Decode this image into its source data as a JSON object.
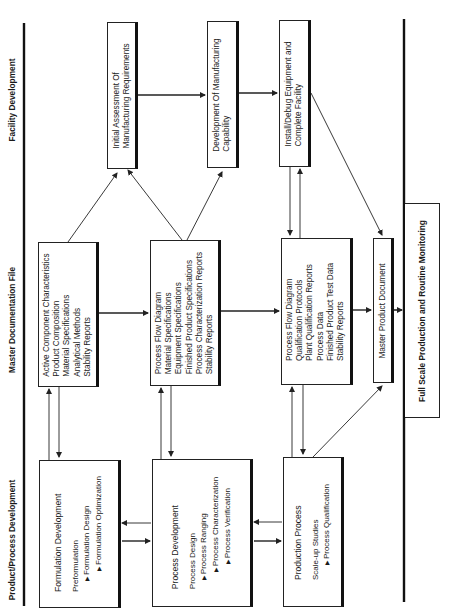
{
  "lanes": {
    "facility": "Facility Development",
    "master": "Master Documentation File",
    "product": "Product/Process Development"
  },
  "facility_boxes": {
    "initial_assessment": [
      "Initial Assessment Of",
      "Manufacturing Requirements"
    ],
    "development_capability": [
      "Development Of Manufacturing",
      "Capability"
    ],
    "install_debug": [
      "Install/Debug Equipment and",
      "Complete Facility"
    ]
  },
  "master_boxes": {
    "formulation_docs": [
      "Active Component Characteristics",
      "Product Composition",
      "Material Specifications",
      "Analytical Methods",
      "Stability Reports"
    ],
    "process_docs": [
      "Process Flow Diagram",
      "Material Specifications",
      "Equipment Specifications",
      "Finished Product Specifications",
      "Process Characterization Reports",
      "Stability Reports"
    ],
    "production_docs": [
      "Process Flow Diagram",
      "Qualification Protocols",
      "Plant Qualification Reports",
      "Process Data",
      "Finished Product Test Data",
      "Stability Reports"
    ],
    "master_product_document": "Master Product Document"
  },
  "product_boxes": {
    "formulation": {
      "title": "Formulation Development",
      "steps": [
        "Preformulation",
        "Formulation Design",
        "Formulation Optimization"
      ]
    },
    "process": {
      "title": "Process Development",
      "steps": [
        "Process Design",
        "Process Ranging",
        "Process Characterization",
        "Process Verification"
      ]
    },
    "production": {
      "title": "Production Process",
      "steps": [
        "Scale-up Studies",
        "Process Qualification"
      ]
    }
  },
  "final_box": "Full Scale Production and Routine Monitoring",
  "colors": {
    "line": "#222222",
    "background": "#ffffff"
  }
}
